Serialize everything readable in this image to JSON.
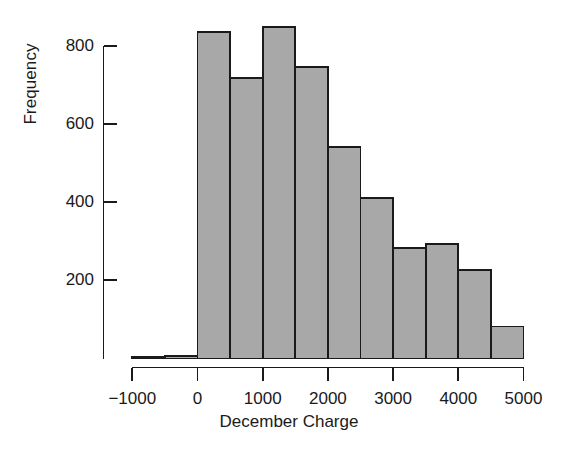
{
  "chart_data": {
    "type": "bar",
    "subtype": "histogram",
    "title": "",
    "xlabel": "December Charge",
    "ylabel": "Frequency",
    "bin_width": 500,
    "bin_starts": [
      -1000,
      -500,
      0,
      500,
      1000,
      1500,
      2000,
      2500,
      3000,
      3500,
      4000,
      4500
    ],
    "bin_ends": [
      -500,
      0,
      500,
      1000,
      1500,
      2000,
      2500,
      3000,
      3500,
      4000,
      4500,
      5000
    ],
    "categories": [
      "-1000 to -500",
      "-500 to 0",
      "0 to 500",
      "500 to 1000",
      "1000 to 1500",
      "1500 to 2000",
      "2000 to 2500",
      "2500 to 3000",
      "3000 to 3500",
      "3500 to 4000",
      "4000 to 4500",
      "4500 to 5000"
    ],
    "values": [
      3,
      6,
      837,
      719,
      850,
      746,
      542,
      411,
      283,
      294,
      226,
      82
    ],
    "xlim": [
      -1200,
      5200
    ],
    "ylim": [
      0,
      880
    ],
    "xticks": [
      -1000,
      0,
      1000,
      2000,
      3000,
      4000,
      5000
    ],
    "xtick_labels": [
      "-1000",
      "0",
      "1000",
      "2000",
      "3000",
      "4000",
      "5000"
    ],
    "yticks": [
      200,
      400,
      600,
      800
    ],
    "ytick_labels": [
      "200",
      "400",
      "600",
      "800"
    ],
    "grid": false,
    "legend": null,
    "bar_fill_color": "#a8a8a8",
    "bar_edge_color": "#1a1a1a",
    "axis_color": "#1a1a1a",
    "background_color": "#ffffff"
  }
}
